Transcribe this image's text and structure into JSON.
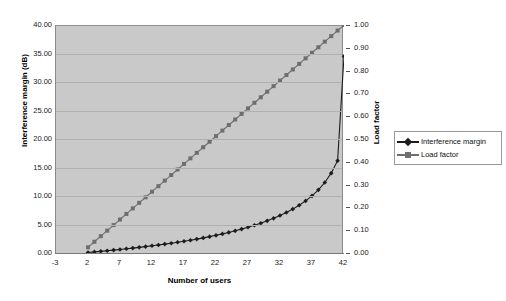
{
  "chart_data": {
    "type": "line",
    "title": "",
    "xlabel": "Number of users",
    "ylabel": "Interference margin (dB)",
    "y2label": "Load factor",
    "xlim": [
      -3,
      42
    ],
    "xticks": [
      -3,
      2,
      7,
      12,
      17,
      22,
      27,
      32,
      37,
      42
    ],
    "xticklabels": [
      "-3",
      "2",
      "7",
      "12",
      "17",
      "22",
      "27",
      "32",
      "37",
      "42"
    ],
    "ylim": [
      0,
      40
    ],
    "yticks": [
      0,
      5,
      10,
      15,
      20,
      25,
      30,
      35,
      40
    ],
    "yticklabels": [
      "0.00",
      "5.00",
      "10.00",
      "15.00",
      "20.00",
      "25.00",
      "30.00",
      "35.00",
      "40.00"
    ],
    "y2lim": [
      0,
      1
    ],
    "y2ticks": [
      0.0,
      0.1,
      0.2,
      0.3,
      0.4,
      0.5,
      0.6,
      0.7,
      0.8,
      0.9,
      1.0
    ],
    "y2ticklabels": [
      "0.00",
      "0.10",
      "0.20",
      "0.30",
      "0.40",
      "0.50",
      "0.60",
      "0.70",
      "0.80",
      "0.90",
      "1.00"
    ],
    "grid": true,
    "legend_position": "right",
    "plot_background": "#c9c9c9",
    "series": [
      {
        "name": "Interference margin",
        "axis": "left",
        "color": "#1c1c1c",
        "marker": "diamond",
        "x": [
          2,
          3,
          4,
          5,
          6,
          7,
          8,
          9,
          10,
          11,
          12,
          13,
          14,
          15,
          16,
          17,
          18,
          19,
          20,
          21,
          22,
          23,
          24,
          25,
          26,
          27,
          28,
          29,
          30,
          31,
          32,
          33,
          34,
          35,
          36,
          37,
          38,
          39,
          40,
          41,
          42
        ],
        "values": [
          0.09,
          0.19,
          0.29,
          0.4,
          0.51,
          0.62,
          0.74,
          0.86,
          0.99,
          1.12,
          1.26,
          1.41,
          1.56,
          1.72,
          1.89,
          2.06,
          2.25,
          2.44,
          2.65,
          2.87,
          3.1,
          3.35,
          3.61,
          3.89,
          4.19,
          4.51,
          4.86,
          5.23,
          5.64,
          6.08,
          6.57,
          7.1,
          7.7,
          8.37,
          9.14,
          10.03,
          11.08,
          12.37,
          14.01,
          16.2,
          34.5
        ]
      },
      {
        "name": "Load factor",
        "axis": "right",
        "color": "#6e6e6e",
        "marker": "square",
        "x": [
          2,
          3,
          4,
          5,
          6,
          7,
          8,
          9,
          10,
          11,
          12,
          13,
          14,
          15,
          16,
          17,
          18,
          19,
          20,
          21,
          22,
          23,
          24,
          25,
          26,
          27,
          28,
          29,
          30,
          31,
          32,
          33,
          34,
          35,
          36,
          37,
          38,
          39,
          40,
          41,
          42
        ],
        "values": [
          0.025,
          0.0494,
          0.0738,
          0.0981,
          0.1225,
          0.1469,
          0.1713,
          0.1956,
          0.22,
          0.2444,
          0.2688,
          0.2931,
          0.3175,
          0.3419,
          0.3663,
          0.3906,
          0.415,
          0.4394,
          0.4638,
          0.4881,
          0.5125,
          0.5369,
          0.5613,
          0.5856,
          0.61,
          0.6344,
          0.6588,
          0.6831,
          0.7075,
          0.7319,
          0.7563,
          0.7806,
          0.805,
          0.8294,
          0.8538,
          0.8781,
          0.9025,
          0.9269,
          0.9513,
          0.9756,
          1.0
        ]
      }
    ]
  },
  "legend": {
    "items": [
      {
        "label": "Interference margin"
      },
      {
        "label": "Load factor"
      }
    ]
  }
}
